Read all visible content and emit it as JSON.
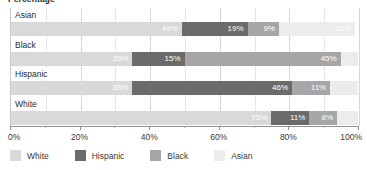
{
  "chart_data": {
    "type": "bar",
    "subtype": "stacked-horizontal-100",
    "title": "Percentage",
    "xlabel": "",
    "ylabel": "",
    "xlim": [
      0,
      100
    ],
    "xticks": [
      "0%",
      "20%",
      "40%",
      "60%",
      "80%",
      "100%"
    ],
    "xtick_values": [
      0,
      20,
      40,
      60,
      80,
      100
    ],
    "minor_tick_values": [
      10,
      30,
      50,
      70,
      90
    ],
    "grid": true,
    "legend_position": "bottom",
    "categories": [
      "Asian",
      "Black",
      "Hispanic",
      "White"
    ],
    "series": [
      {
        "name": "White",
        "color": "#d9d9d9",
        "values": [
          49,
          35,
          35,
          75
        ]
      },
      {
        "name": "Hispanic",
        "color": "#6b6b6b",
        "values": [
          19,
          15,
          46,
          11
        ]
      },
      {
        "name": "Black",
        "color": "#a6a6a6",
        "values": [
          9,
          45,
          11,
          8
        ]
      },
      {
        "name": "Asian",
        "color": "#ececec",
        "values": [
          22,
          5,
          8,
          6
        ]
      }
    ],
    "bar_labels": [
      [
        "49%",
        "19%",
        "9%",
        "22%"
      ],
      [
        "35%",
        "15%",
        "45%",
        ""
      ],
      [
        "35%",
        "46%",
        "11%",
        ""
      ],
      [
        "75%",
        "11%",
        "8%",
        ""
      ]
    ]
  },
  "legend": {
    "items": [
      {
        "label": "White",
        "color": "#d9d9d9"
      },
      {
        "label": "Hispanic",
        "color": "#6b6b6b"
      },
      {
        "label": "Black",
        "color": "#a6a6a6"
      },
      {
        "label": "Asian",
        "color": "#ececec"
      }
    ]
  },
  "colors": {
    "white_series": "#d9d9d9",
    "hispanic_series": "#6b6b6b",
    "black_series": "#a6a6a6",
    "asian_series": "#ececec",
    "gridline": "#d6d6d6",
    "axis": "#8f8f8f",
    "text": "#3a3a3a"
  }
}
